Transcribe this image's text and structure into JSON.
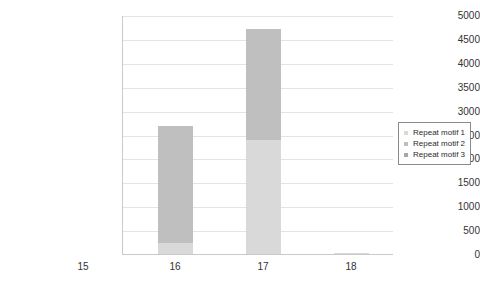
{
  "chart_data": {
    "type": "bar",
    "stacked": true,
    "title": "",
    "xlabel": "",
    "ylabel": "",
    "categories": [
      "15",
      "16",
      "17",
      "18"
    ],
    "ylim": [
      0,
      5000
    ],
    "yticks": [
      0,
      500,
      1000,
      1500,
      2000,
      2500,
      3000,
      3500,
      4000,
      4500,
      5000
    ],
    "ytick_labels": [
      "0",
      "500",
      "1000",
      "1500",
      "2000",
      "2500",
      "3000",
      "3500",
      "4000",
      "4500",
      "5000"
    ],
    "grid": true,
    "legend_position": "right",
    "series": [
      {
        "name": "Repeat motif 1",
        "color": "#d9d9d9",
        "values": [
          0,
          230,
          2380,
          30
        ]
      },
      {
        "name": "Repeat motif 2",
        "color": "#bfbfbf",
        "values": [
          0,
          2440,
          2320,
          0
        ]
      },
      {
        "name": "Repeat motif 3",
        "color": "#a6a6a6",
        "values": [
          0,
          0,
          0,
          0
        ]
      }
    ],
    "totals": [
      0,
      2670,
      4700,
      30
    ]
  },
  "axes": {
    "ytick_0": "0",
    "ytick_1": "500",
    "ytick_2": "1000",
    "ytick_3": "1500",
    "ytick_4": "2000",
    "ytick_5": "2500",
    "ytick_6": "3000",
    "ytick_7": "3500",
    "ytick_8": "4000",
    "ytick_9": "4500",
    "ytick_10": "5000",
    "xtick_0": "15",
    "xtick_1": "16",
    "xtick_2": "17",
    "xtick_3": "18"
  },
  "legend": {
    "items": [
      {
        "label": "Repeat motif 1",
        "color": "#d9d9d9"
      },
      {
        "label": "Repeat motif 2",
        "color": "#bfbfbf"
      },
      {
        "label": "Repeat motif 3",
        "color": "#a6a6a6"
      }
    ]
  }
}
